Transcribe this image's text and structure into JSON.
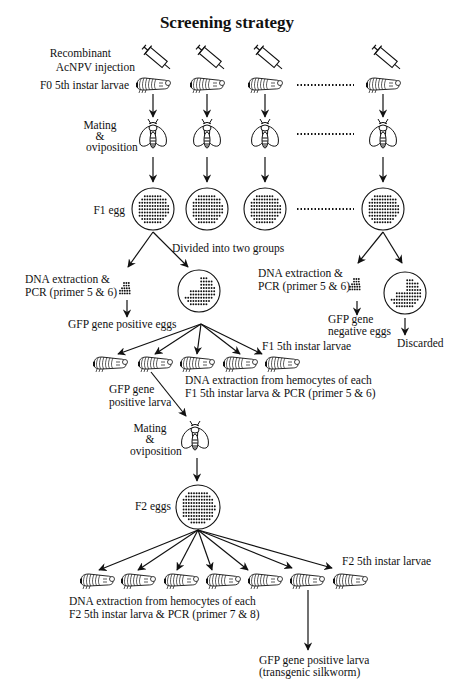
{
  "title": "Screening strategy",
  "labels": {
    "injection_line1": "Recombinant",
    "injection_line2": "AcNPV injection",
    "f0_larvae": "F0 5th instar larvae",
    "mating1_line1": "Mating",
    "mating1_line2": "&",
    "mating1_line3": "oviposition",
    "f1_egg": "F1 egg",
    "divided": "Divided into two groups",
    "dna_left_line1": "DNA extraction &",
    "dna_left_line2": "PCR (primer 5 & 6)",
    "gfp_positive_eggs": "GFP gene positive eggs",
    "dna_right_line1": "DNA extraction &",
    "dna_right_line2": "PCR (primer 5 & 6)",
    "gfp_negative_line1": "GFP gene",
    "gfp_negative_line2": "negative eggs",
    "discarded": "Discarded",
    "f1_larvae": "F1 5th instar larvae",
    "gfp_pos_larva_line1": "GFP gene",
    "gfp_pos_larva_line2": "positive larva",
    "dna_hemo_f1_line1": "DNA extraction from hemocytes of each",
    "dna_hemo_f1_line2": "F1 5th instar larva & PCR (primer 5 & 6)",
    "mating2_line1": "Mating",
    "mating2_line2": "&",
    "mating2_line3": "oviposition",
    "f2_eggs": "F2 eggs",
    "f2_larvae": "F2 5th instar larvae",
    "dna_hemo_f2_line1": "DNA extraction from hemocytes of each",
    "dna_hemo_f2_line2": "F2 5th instar larva & PCR (primer 7 & 8)",
    "final_line1": "GFP gene positive larva",
    "final_line2": "(transgenic silkworm)"
  },
  "icons": {
    "syringe": "syringe-icon",
    "larva": "silkworm-larva-icon",
    "moth": "silkmoth-icon",
    "egg_plate": "egg-plate-icon"
  },
  "counts": {
    "f0_columns_shown": 4,
    "f1_larvae_shown": 5,
    "f2_larvae_shown": 7
  }
}
